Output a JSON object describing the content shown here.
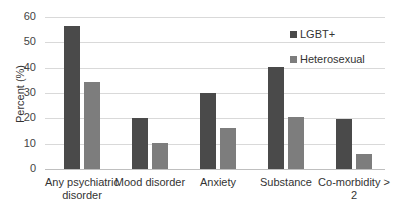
{
  "chart_data": {
    "type": "bar",
    "title": "",
    "xlabel": "",
    "ylabel": "Percent (%)",
    "ylim": [
      0,
      60
    ],
    "yticks": [
      0,
      10,
      20,
      30,
      40,
      50,
      60
    ],
    "grid": true,
    "legend_position": "top-right",
    "categories": [
      "Any psychiatric disorder",
      "Mood disorder",
      "Anxiety",
      "Substance",
      "Co-morbidity > 2"
    ],
    "series": [
      {
        "name": "LGBT+",
        "color": "#4a4a4a",
        "values": [
          56.5,
          20.2,
          30.0,
          40.3,
          19.6
        ]
      },
      {
        "name": "Heterosexual",
        "color": "#7d7d7d",
        "values": [
          34.4,
          10.1,
          16.0,
          20.5,
          6.0
        ]
      }
    ]
  }
}
